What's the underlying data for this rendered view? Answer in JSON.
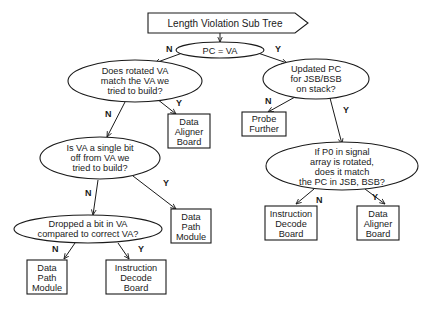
{
  "title": "Length Violation Sub Tree",
  "nodes": {
    "root": {
      "type": "decision",
      "lines": [
        "PC = VA"
      ]
    },
    "q_rotated": {
      "type": "decision",
      "lines": [
        "Does rotated VA",
        "match the VA we",
        "tried to build?"
      ]
    },
    "q_updated_pc": {
      "type": "decision",
      "lines": [
        "Updated PC",
        "for JSB/BSB",
        "on stack?"
      ]
    },
    "r_data_aligner_1": {
      "type": "result",
      "lines": [
        "Data",
        "Aligner",
        "Board"
      ]
    },
    "r_probe": {
      "type": "result",
      "lines": [
        "Probe",
        "Further"
      ]
    },
    "q_single_bit": {
      "type": "decision",
      "lines": [
        "Is VA a single bit",
        "off from VA we",
        "tried to build?"
      ]
    },
    "q_p0": {
      "type": "decision",
      "lines": [
        "If P0 in signal",
        "array is rotated,",
        "does it match",
        "the PC in JSB, BSB?"
      ]
    },
    "r_data_path_1": {
      "type": "result",
      "lines": [
        "Data",
        "Path",
        "Module"
      ]
    },
    "q_dropped": {
      "type": "decision",
      "lines": [
        "Dropped a bit in VA",
        "compared to correct VA?"
      ]
    },
    "r_instr_decode_2": {
      "type": "result",
      "lines": [
        "Instruction",
        "Decode",
        "Board"
      ]
    },
    "r_data_aligner_2": {
      "type": "result",
      "lines": [
        "Data",
        "Aligner",
        "Board"
      ]
    },
    "r_data_path_2": {
      "type": "result",
      "lines": [
        "Data",
        "Path",
        "Module"
      ]
    },
    "r_instr_decode_1": {
      "type": "result",
      "lines": [
        "Instruction",
        "Decode",
        "Board"
      ]
    }
  },
  "edges": [
    {
      "from": "title",
      "to": "root",
      "label": ""
    },
    {
      "from": "root",
      "to": "q_rotated",
      "label": "N"
    },
    {
      "from": "root",
      "to": "q_updated_pc",
      "label": "Y"
    },
    {
      "from": "q_rotated",
      "to": "q_single_bit",
      "label": "N"
    },
    {
      "from": "q_rotated",
      "to": "r_data_aligner_1",
      "label": "Y"
    },
    {
      "from": "q_updated_pc",
      "to": "r_probe",
      "label": "N"
    },
    {
      "from": "q_updated_pc",
      "to": "q_p0",
      "label": "Y"
    },
    {
      "from": "q_single_bit",
      "to": "q_dropped",
      "label": "N"
    },
    {
      "from": "q_single_bit",
      "to": "r_data_path_1",
      "label": "Y"
    },
    {
      "from": "q_p0",
      "to": "r_instr_decode_2",
      "label": "N"
    },
    {
      "from": "q_p0",
      "to": "r_data_aligner_2",
      "label": "Y"
    },
    {
      "from": "q_dropped",
      "to": "r_data_path_2",
      "label": "N"
    },
    {
      "from": "q_dropped",
      "to": "r_instr_decode_1",
      "label": "Y"
    }
  ],
  "labels": {
    "root_n": "N",
    "root_y": "Y",
    "rotated_n": "N",
    "rotated_y": "Y",
    "updated_n": "N",
    "updated_y": "Y",
    "single_n": "N",
    "single_y": "Y",
    "p0_n": "N",
    "p0_y": "Y",
    "dropped_n": "N",
    "dropped_y": "Y"
  },
  "colors": {
    "stroke": "#1a1a1a",
    "background": "#ffffff"
  }
}
